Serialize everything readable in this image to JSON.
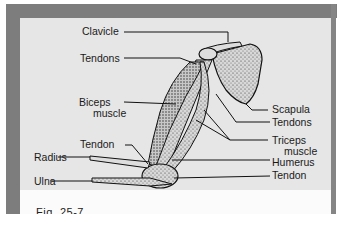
{
  "figure": {
    "caption": "Fig. 25-7"
  },
  "labels": {
    "clavicle": "Clavicle",
    "tendons_top": "Tendons",
    "biceps_line1": "Biceps",
    "biceps_line2": "muscle",
    "tendon_left": "Tendon",
    "radius": "Radius",
    "ulna": "Ulna",
    "scapula": "Scapula",
    "tendons_right": "Tendons",
    "triceps_line1": "Triceps",
    "triceps_line2": "muscle",
    "humerus": "Humerus",
    "tendon_right": "Tendon"
  },
  "colors": {
    "frame": "#7d7d7d",
    "panel": "#e6e6e6",
    "ink": "#1a1a1a"
  }
}
